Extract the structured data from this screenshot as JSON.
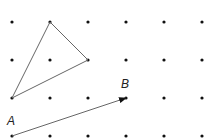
{
  "grid": {
    "columns_x": [
      12,
      50,
      88,
      126,
      164,
      202
    ],
    "rows_y": [
      22,
      60,
      98,
      136
    ],
    "dot_color": "#111111"
  },
  "triangle": {
    "vertices": [
      [
        50,
        22
      ],
      [
        88,
        60
      ],
      [
        12,
        98
      ]
    ],
    "stroke": "#666666"
  },
  "vector": {
    "start": [
      12,
      136
    ],
    "end": [
      126,
      98
    ],
    "start_label": "A",
    "end_label": "B",
    "stroke": "#666666"
  }
}
